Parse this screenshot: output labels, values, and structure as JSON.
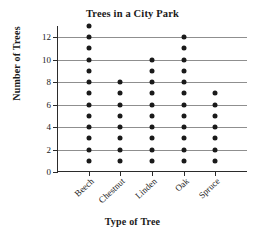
{
  "chart_data": {
    "type": "scatter",
    "plot_style": "dot-plot",
    "title": "Trees in a City Park",
    "xlabel": "Type of Tree",
    "ylabel": "Number of Trees",
    "categories": [
      "Beech",
      "Chestnut",
      "Linden",
      "Oak",
      "Spruce"
    ],
    "values": [
      13,
      8,
      10,
      12,
      7
    ],
    "series": [
      {
        "name": "Number of Trees",
        "values": [
          13,
          8,
          10,
          12,
          7
        ]
      }
    ],
    "column_dot_values": [
      [
        1,
        2,
        3,
        4,
        5,
        6,
        7,
        8,
        9,
        10,
        11,
        12,
        13
      ],
      [
        1,
        2,
        3,
        4,
        5,
        6,
        7,
        8
      ],
      [
        1,
        2,
        3,
        4,
        5,
        6,
        7,
        8,
        9,
        10
      ],
      [
        1,
        2,
        3,
        4,
        5,
        6,
        7,
        8,
        9,
        10,
        11,
        12
      ],
      [
        1,
        2,
        3,
        4,
        5,
        6,
        7
      ]
    ],
    "ylim": [
      0,
      13
    ],
    "yticks": [
      0,
      2,
      4,
      6,
      8,
      10,
      12
    ],
    "ytick_labels": [
      "0",
      "2",
      "4",
      "6",
      "8",
      "10",
      "12"
    ],
    "gridlines": [
      2,
      4,
      6,
      8,
      10,
      12
    ],
    "grid": true,
    "grid_axis": "y",
    "legend": false,
    "colors": {
      "dot": "#1a1a1a",
      "axis": "#2b2b2b",
      "gridline": "#8f8f8f",
      "background": "#ffffff",
      "text": "#1a1a1a"
    }
  }
}
